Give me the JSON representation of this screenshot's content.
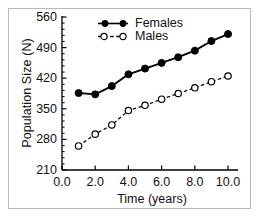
{
  "figure": {
    "background": "#ffffff",
    "frame_color": "#b9b9b9",
    "line_color": "#000000"
  },
  "chart_data": {
    "type": "line",
    "title": "",
    "xlabel": "Time (years)",
    "ylabel": "Population Size (N)",
    "xlim": [
      0.0,
      10.6
    ],
    "ylim": [
      210,
      560
    ],
    "xticks": [
      "0.0",
      "2.0",
      "4.0",
      "6.0",
      "8.0",
      "10.0"
    ],
    "xtick_values": [
      0.0,
      2.0,
      4.0,
      6.0,
      8.0,
      10.0
    ],
    "yticks": [
      "210",
      "280",
      "350",
      "420",
      "490",
      "560"
    ],
    "ytick_values": [
      210,
      280,
      350,
      420,
      490,
      560
    ],
    "minor_ticks_per_interval": 4,
    "grid": false,
    "legend_position": "upper-left-inside",
    "x": [
      1,
      2,
      3,
      4,
      5,
      6,
      7,
      8,
      9,
      10
    ],
    "series": [
      {
        "name": "Females",
        "marker": "filled-circle",
        "linestyle": "solid",
        "color": "#000000",
        "values": [
          386,
          383,
          402,
          429,
          442,
          455,
          468,
          483,
          505,
          521
        ]
      },
      {
        "name": "Males",
        "marker": "open-circle",
        "linestyle": "dashed",
        "color": "#000000",
        "values": [
          265,
          292,
          313,
          346,
          358,
          372,
          385,
          398,
          412,
          425
        ]
      }
    ]
  },
  "legend": {
    "entries": [
      {
        "label": "Females",
        "marker": "filled-circle",
        "linestyle": "solid"
      },
      {
        "label": "Males",
        "marker": "open-circle",
        "linestyle": "dashed"
      }
    ]
  }
}
